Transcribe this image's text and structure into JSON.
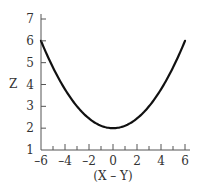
{
  "chart_data": {
    "type": "line",
    "title": "",
    "xlabel": "(X – Y)",
    "ylabel": "Z",
    "xlim": [
      -6,
      6
    ],
    "ylim": [
      1,
      7
    ],
    "grid": false,
    "x_ticks": [
      -6,
      -4,
      -2,
      0,
      2,
      4,
      6
    ],
    "x_minor_ticks": [
      -5,
      -3,
      -1,
      1,
      3,
      5
    ],
    "y_ticks": [
      1,
      2,
      3,
      4,
      5,
      6,
      7
    ],
    "series": [
      {
        "name": "Z",
        "x": [
          -6,
          -5,
          -4,
          -3,
          -2,
          -1,
          0,
          1,
          2,
          3,
          4,
          5,
          6
        ],
        "values": [
          6.0,
          4.78,
          3.78,
          3.0,
          2.44,
          2.11,
          2.0,
          2.11,
          2.44,
          3.0,
          3.78,
          4.78,
          6.0
        ]
      }
    ],
    "colors": {
      "curve": "#111111",
      "axis": "#555555",
      "text": "#333333"
    }
  },
  "labels": {
    "x_axis_title": "(X – Y)",
    "y_axis_title": "Z",
    "x_tick_labels": [
      "–6",
      "–4",
      "–2",
      "0",
      "2",
      "4",
      "6"
    ],
    "y_tick_labels": [
      "1",
      "2",
      "3",
      "4",
      "5",
      "6",
      "7"
    ]
  }
}
